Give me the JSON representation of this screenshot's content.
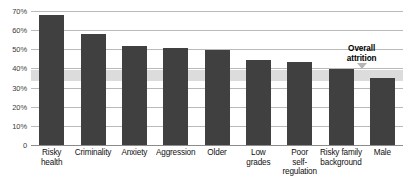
{
  "chart_data": {
    "type": "bar",
    "title": "",
    "subtitle": "",
    "xlabel": "",
    "ylabel": "",
    "ylim": [
      0,
      70
    ],
    "grid": true,
    "legend": "none",
    "categories": [
      "Risky health",
      "Criminality",
      "Anxiety",
      "Aggression",
      "Older",
      "Low grades",
      "Poor self-regulation",
      "Risky family background",
      "Male"
    ],
    "category_lines": [
      [
        "Risky",
        "health"
      ],
      [
        "Criminality"
      ],
      [
        "Anxiety"
      ],
      [
        "Aggression"
      ],
      [
        "Older"
      ],
      [
        "Low",
        "grades"
      ],
      [
        "Poor",
        "self-",
        "regulation"
      ],
      [
        "Risky family",
        "background"
      ],
      [
        "Male"
      ]
    ],
    "values": [
      68,
      58,
      51.5,
      50.5,
      49.5,
      44.5,
      43.5,
      39.5,
      35
    ],
    "ytick_values": [
      0,
      10,
      20,
      30,
      40,
      50,
      60,
      70
    ],
    "ytick_labels": [
      "0",
      "10%",
      "20%",
      "30%",
      "40%",
      "50%",
      "60%",
      "70%"
    ],
    "bands": [
      {
        "name": "Overall attrition",
        "from": 33.5,
        "to": 39.0,
        "color": "#dcdcdc"
      }
    ],
    "annotations": [
      {
        "name": "overall-attrition",
        "lines": [
          "Overall",
          "attrition"
        ],
        "text": "Overall attrition",
        "points_to_value": 39.0
      }
    ],
    "colors": {
      "bar": "#404040",
      "band": "#dcdcdc",
      "gridline": "#b9b9b9",
      "axis": "#8c8c8c",
      "text": "#111111",
      "background": "#ffffff"
    }
  }
}
